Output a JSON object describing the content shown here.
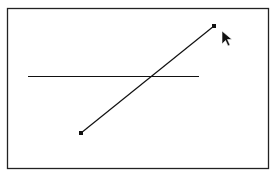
{
  "canvas": {
    "frame": {
      "x": 7,
      "y": 8,
      "w": 261,
      "h": 160,
      "stroke": "#222222"
    },
    "horizontal_line": {
      "x1": 28,
      "y1": 76,
      "x2": 199,
      "y2": 76,
      "stroke": "#111111"
    },
    "selected_line": {
      "x1": 81,
      "y1": 133,
      "x2": 214,
      "y2": 26,
      "stroke": "#111111",
      "handles": [
        {
          "x": 81,
          "y": 133
        },
        {
          "x": 214,
          "y": 26
        }
      ]
    },
    "cursor": {
      "x": 222,
      "y": 31,
      "icon": "arrow-pointer-icon"
    }
  }
}
